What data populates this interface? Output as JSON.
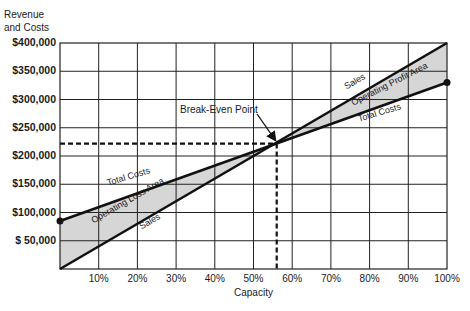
{
  "chart_data": {
    "type": "line",
    "title": "",
    "xlabel": "Capacity",
    "ylabel": "Revenue and Costs",
    "ylabel_lines": [
      "Revenue",
      "and Costs"
    ],
    "x_ticks": [
      "10%",
      "20%",
      "30%",
      "40%",
      "50%",
      "60%",
      "70%",
      "80%",
      "90%",
      "100%"
    ],
    "y_ticks": [
      "$400,000",
      "$350,000",
      "$300,000",
      "$250,000",
      "$200,000",
      "$150,000",
      "$100,000",
      "$ 50,000"
    ],
    "xlim": [
      0,
      100
    ],
    "ylim": [
      0,
      400000
    ],
    "grid": true,
    "legend": "none",
    "series": [
      {
        "name": "Sales",
        "x": [
          0,
          100
        ],
        "values": [
          0,
          400000
        ]
      },
      {
        "name": "Total Costs",
        "x": [
          0,
          100
        ],
        "values": [
          85000,
          330000
        ]
      }
    ],
    "break_even": {
      "label": "Break-Even Point",
      "x": 56,
      "y": 222000
    },
    "annotations": [
      {
        "text": "Total Costs",
        "region": "below break-even, above line"
      },
      {
        "text": "Operating Loss Area",
        "region": "between lines, left of break-even"
      },
      {
        "text": "Sales",
        "region": "below break-even, below line"
      },
      {
        "text": "Sales",
        "region": "above break-even, above line"
      },
      {
        "text": "Operating Profit Area",
        "region": "between lines, right of break-even"
      },
      {
        "text": "Total Costs",
        "region": "above break-even, below line"
      }
    ],
    "colors": {
      "lines": "#111111",
      "fill": "#d6d6d6",
      "grid": "#222222"
    }
  },
  "labels": {
    "ylabel_line1": "Revenue",
    "ylabel_line2": "and Costs",
    "xlabel": "Capacity",
    "break_even": "Break-Even Point",
    "tc_left": "Total Costs",
    "loss_area": "Operating Loss Area",
    "sales_left": "Sales",
    "sales_right": "Sales",
    "profit_area": "Operating Profit Area",
    "tc_right": "Total Costs"
  }
}
